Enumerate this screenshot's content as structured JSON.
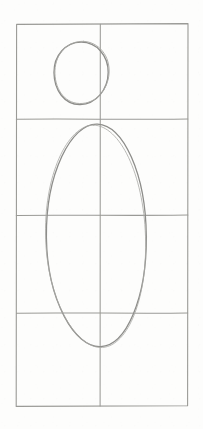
{
  "document": {
    "title": "Hand-drawn figure proportion sketch",
    "medium": "pencil on paper",
    "background_color": "#fdfdfc",
    "canvas": {
      "width": 203,
      "height": 429
    }
  },
  "stroke": {
    "grid_color": "#9a9a96",
    "grid_width": 1.1,
    "shape_color": "#8d8d8a",
    "shape_width": 1.3,
    "style": "graphite-pencil"
  },
  "grid": {
    "name": "proportion-grid",
    "left": 16,
    "right": 188,
    "top": 24,
    "bottom": 406,
    "columns": 2,
    "rows": 4,
    "vertical_lines_x": [
      16,
      100,
      188
    ],
    "horizontal_lines_y": [
      24,
      119,
      215,
      313,
      406
    ],
    "cell_width": 86,
    "cell_height": 95
  },
  "shapes": [
    {
      "name": "head-circle",
      "type": "circle",
      "center_x": 81,
      "center_y": 73,
      "radius_x": 27,
      "radius_y": 31,
      "label": "head"
    },
    {
      "name": "torso-ellipse",
      "type": "ellipse",
      "center_x": 96,
      "center_y": 236,
      "radius_x": 50,
      "radius_y": 112,
      "label": "torso"
    }
  ],
  "paths": {
    "grid_outer": "M16.6,24.4 L188.0,23.6 L187.6,405.8 L16.2,406.4 Z",
    "grid_vertical_mid": "M100.3,24.2 C100.0,120 100.6,250 100.1,406.0",
    "grid_h1": "M16.4,119.3 C60,118.6 140,119.8 187.8,119.0",
    "grid_h2": "M16.3,215.4 C60,214.8 140,215.9 187.9,215.1",
    "grid_h3": "M16.5,313.2 C60,312.5 140,313.7 187.7,313.0",
    "head_circle": "M81,42.2 C96.5,42.0 108.4,55.6 108.2,72.6 C108.0,89.8 96.0,104.2 80.2,104.5 C64.4,104.8 54.2,90.0 54.0,72.8 C53.8,55.4 65.6,42.4 81,42.2 Z",
    "torso_ellipse": "M97.5,124.1 C123.5,125.4 145.8,174.0 146.3,236.5 C146.8,298.0 126.2,345.4 100.6,346.6 C74.8,347.8 47.2,300.4 46.4,237.6 C45.6,174.2 71.2,122.8 97.5,124.1 Z"
  }
}
